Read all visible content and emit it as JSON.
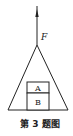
{
  "diagram": {
    "force_label": "F",
    "block_top_label": "A",
    "block_bottom_label": "B",
    "caption": "第 3 题图",
    "colors": {
      "line": "#222222",
      "background": "#ffffff"
    }
  }
}
